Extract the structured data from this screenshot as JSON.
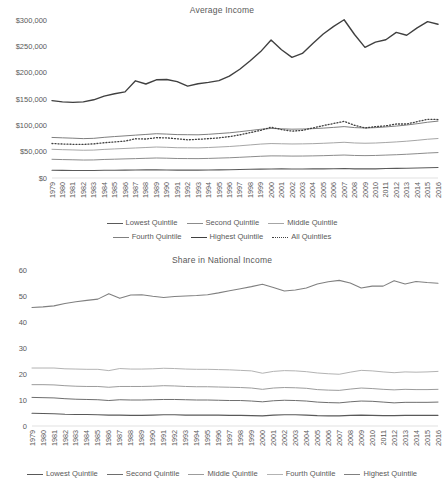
{
  "page": {
    "background": "#ffffff",
    "text_color": "#595959"
  },
  "years": [
    1979,
    1980,
    1981,
    1982,
    1983,
    1984,
    1985,
    1986,
    1987,
    1988,
    1989,
    1990,
    1991,
    1992,
    1993,
    1994,
    1995,
    1996,
    1997,
    1998,
    1999,
    2000,
    2001,
    2002,
    2003,
    2004,
    2005,
    2006,
    2007,
    2008,
    2009,
    2010,
    2011,
    2012,
    2013,
    2014,
    2015,
    2016
  ],
  "charts": [
    {
      "id": "average-income",
      "title": "Average Income",
      "legend_rows": [
        [
          "Lowest Quintile",
          "Second Quintile",
          "Middle Quintile"
        ],
        [
          "Fourth Quintile",
          "Highest Quintile",
          "All Quintiles"
        ]
      ]
    },
    {
      "id": "share-in-national-income",
      "title": "Share in National Income",
      "legend_rows": [
        [
          "Lowest Quintile",
          "Second Quintile",
          "Middle Quintile",
          "Fourth Quintile",
          "Highest Quintile"
        ]
      ]
    }
  ],
  "chart_data": [
    {
      "type": "line",
      "id": "average-income",
      "title": "Average Income",
      "xlabel": "",
      "ylabel": "",
      "ylim": [
        0,
        300000
      ],
      "ytick_step": 50000,
      "ytick_labels": [
        "$0",
        "$50,000",
        "$100,000",
        "$150,000",
        "$200,000",
        "$250,000",
        "$300,000"
      ],
      "grid": false,
      "legend_position": "bottom",
      "x": [
        1979,
        1980,
        1981,
        1982,
        1983,
        1984,
        1985,
        1986,
        1987,
        1988,
        1989,
        1990,
        1991,
        1992,
        1993,
        1994,
        1995,
        1996,
        1997,
        1998,
        1999,
        2000,
        2001,
        2002,
        2003,
        2004,
        2005,
        2006,
        2007,
        2008,
        2009,
        2010,
        2011,
        2012,
        2013,
        2014,
        2015,
        2016
      ],
      "series": [
        {
          "name": "Lowest Quintile",
          "color": "#5a5a5a",
          "width": 1.1,
          "dash": "none",
          "values": [
            14800,
            14500,
            14300,
            14100,
            14200,
            14600,
            14800,
            15000,
            15300,
            15400,
            15600,
            15300,
            15000,
            15000,
            14900,
            15100,
            15400,
            15600,
            16000,
            16500,
            16900,
            17200,
            17300,
            17200,
            17200,
            17300,
            17400,
            17600,
            17900,
            17400,
            17300,
            17400,
            17900,
            18200,
            18600,
            19000,
            19600,
            20000
          ]
        },
        {
          "name": "Second Quintile",
          "color": "#8c8c8c",
          "width": 1.0,
          "dash": "none",
          "values": [
            35500,
            35000,
            34600,
            34100,
            34300,
            35200,
            35700,
            36300,
            36800,
            37400,
            38000,
            37600,
            37000,
            36900,
            36800,
            37200,
            37800,
            38400,
            39300,
            40300,
            41300,
            42000,
            41900,
            41600,
            41700,
            42000,
            42400,
            43000,
            43600,
            42800,
            42500,
            42800,
            43500,
            44200,
            45100,
            46200,
            47400,
            48300
          ]
        },
        {
          "name": "Middle Quintile",
          "color": "#a6a6a6",
          "width": 1.0,
          "dash": "none",
          "values": [
            54500,
            53800,
            53300,
            52700,
            53000,
            54300,
            55200,
            56100,
            57000,
            57900,
            58800,
            58300,
            57500,
            57400,
            57200,
            57900,
            58800,
            59800,
            61200,
            62800,
            64400,
            65400,
            65000,
            64600,
            64800,
            65200,
            65900,
            66800,
            67800,
            66500,
            66000,
            66400,
            67400,
            68500,
            69900,
            71600,
            73600,
            75000
          ]
        },
        {
          "name": "Fourth Quintile",
          "color": "#7f7f7f",
          "width": 1.0,
          "dash": "none",
          "values": [
            77000,
            76300,
            75600,
            74800,
            75300,
            77200,
            78700,
            80000,
            81400,
            82700,
            84100,
            83400,
            82400,
            82200,
            82000,
            83000,
            84400,
            85800,
            87900,
            90200,
            92500,
            94100,
            93400,
            92700,
            93000,
            93700,
            94700,
            96100,
            97600,
            95700,
            95000,
            95600,
            97000,
            98600,
            100600,
            103100,
            105900,
            108000
          ]
        },
        {
          "name": "Highest Quintile",
          "color": "#404040",
          "width": 1.4,
          "dash": "none",
          "values": [
            147000,
            144500,
            143500,
            144500,
            148500,
            155500,
            160000,
            163500,
            184500,
            178500,
            186500,
            187000,
            183000,
            174500,
            179000,
            181500,
            185000,
            193500,
            206500,
            222500,
            240000,
            262000,
            243500,
            229000,
            236500,
            255500,
            273500,
            288000,
            300500,
            272500,
            248000,
            258000,
            262500,
            276500,
            271000,
            285000,
            297000,
            292000
          ]
        },
        {
          "name": "All Quintiles",
          "color": "#404040",
          "width": 1.3,
          "dash": "1,2",
          "values": [
            65500,
            64500,
            64000,
            63800,
            64800,
            67000,
            68500,
            70000,
            74500,
            74000,
            76500,
            76200,
            74500,
            72500,
            73500,
            74700,
            76200,
            78600,
            82000,
            86200,
            90500,
            96500,
            92000,
            89000,
            90500,
            95000,
            99500,
            103500,
            107500,
            100000,
            95000,
            97500,
            99000,
            102500,
            102500,
            107000,
            111500,
            111000
          ]
        }
      ]
    },
    {
      "type": "line",
      "id": "share-in-national-income",
      "title": "Share in National Income",
      "xlabel": "",
      "ylabel": "",
      "ylim": [
        0,
        60
      ],
      "ytick_step": 10,
      "ytick_labels": [
        "0",
        "10",
        "20",
        "30",
        "40",
        "50",
        "60"
      ],
      "grid": false,
      "legend_position": "bottom",
      "x": [
        1979,
        1980,
        1981,
        1982,
        1983,
        1984,
        1985,
        1986,
        1987,
        1988,
        1989,
        1990,
        1991,
        1992,
        1993,
        1994,
        1995,
        1996,
        1997,
        1998,
        1999,
        2000,
        2001,
        2002,
        2003,
        2004,
        2005,
        2006,
        2007,
        2008,
        2009,
        2010,
        2011,
        2012,
        2013,
        2014,
        2015,
        2016
      ],
      "series": [
        {
          "name": "Lowest Quintile",
          "color": "#595959",
          "width": 1.1,
          "dash": "none",
          "values": [
            4.9,
            4.8,
            4.7,
            4.5,
            4.4,
            4.4,
            4.3,
            4.2,
            4.2,
            4.1,
            4.1,
            4.2,
            4.3,
            4.3,
            4.2,
            4.2,
            4.2,
            4.2,
            4.1,
            4.1,
            4.0,
            3.9,
            4.2,
            4.3,
            4.3,
            4.2,
            4.0,
            3.9,
            3.9,
            4.1,
            4.2,
            4.1,
            4.0,
            4.0,
            4.1,
            4.1,
            4.1,
            4.1
          ]
        },
        {
          "name": "Second Quintile",
          "color": "#6e6e6e",
          "width": 1.0,
          "dash": "none",
          "values": [
            11.0,
            10.9,
            10.8,
            10.5,
            10.3,
            10.2,
            10.1,
            9.8,
            10.1,
            10.0,
            10.0,
            10.1,
            10.2,
            10.2,
            10.1,
            10.0,
            10.0,
            9.9,
            9.8,
            9.8,
            9.6,
            9.3,
            9.7,
            9.9,
            9.8,
            9.6,
            9.2,
            9.0,
            8.9,
            9.3,
            9.6,
            9.5,
            9.2,
            8.9,
            9.1,
            9.1,
            9.1,
            9.2
          ]
        },
        {
          "name": "Middle Quintile",
          "color": "#9c9c9c",
          "width": 1.0,
          "dash": "none",
          "values": [
            15.9,
            15.9,
            15.8,
            15.5,
            15.3,
            15.2,
            15.2,
            14.9,
            15.2,
            15.2,
            15.2,
            15.3,
            15.5,
            15.4,
            15.2,
            15.1,
            15.1,
            15.0,
            14.9,
            14.8,
            14.6,
            14.1,
            14.6,
            14.8,
            14.7,
            14.5,
            14.0,
            13.8,
            13.7,
            14.2,
            14.6,
            14.4,
            14.1,
            13.9,
            14.1,
            14.0,
            14.0,
            14.1
          ]
        },
        {
          "name": "Fourth Quintile",
          "color": "#b3b3b3",
          "width": 1.0,
          "dash": "none",
          "values": [
            22.3,
            22.3,
            22.3,
            22.0,
            21.9,
            21.8,
            21.8,
            21.3,
            22.1,
            21.9,
            21.9,
            22.0,
            22.2,
            22.1,
            21.9,
            21.8,
            21.8,
            21.7,
            21.6,
            21.4,
            21.2,
            20.3,
            21.0,
            21.3,
            21.2,
            20.9,
            20.4,
            20.1,
            19.9,
            20.7,
            21.4,
            21.2,
            20.8,
            20.5,
            20.8,
            20.7,
            20.8,
            21.0
          ]
        },
        {
          "name": "Highest Quintile",
          "color": "#808080",
          "width": 1.1,
          "dash": "none",
          "values": [
            45.6,
            45.8,
            46.2,
            47.1,
            47.8,
            48.3,
            48.8,
            50.9,
            49.1,
            50.4,
            50.5,
            49.9,
            49.4,
            49.8,
            50.0,
            50.2,
            50.5,
            51.2,
            52.0,
            52.8,
            53.6,
            54.5,
            53.3,
            51.9,
            52.3,
            53.1,
            54.6,
            55.5,
            56.0,
            55.0,
            53.1,
            53.8,
            53.8,
            55.9,
            54.6,
            55.6,
            55.2,
            54.9
          ]
        }
      ]
    }
  ]
}
